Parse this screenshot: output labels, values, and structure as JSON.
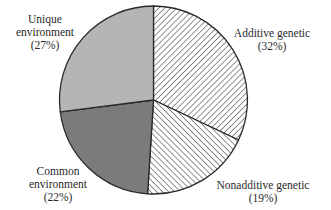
{
  "chart_data": {
    "type": "pie",
    "title": "",
    "start_angle_deg": 0,
    "direction": "clockwise",
    "slices": [
      {
        "label": "Additive genetic",
        "value": 32,
        "display": "(32%)",
        "fill": "hatch-forward",
        "color": "#ffffff"
      },
      {
        "label": "Nonadditive genetic",
        "value": 19,
        "display": "(19%)",
        "fill": "hatch-back",
        "color": "#ffffff"
      },
      {
        "label": "Common environment",
        "value": 22,
        "display": "(22%)",
        "fill": "solid",
        "color": "#7b7b7b"
      },
      {
        "label": "Unique environment",
        "value": 27,
        "display": "(27%)",
        "fill": "solid",
        "color": "#b5b5b5"
      }
    ],
    "categories": [
      "Additive genetic",
      "Nonadditive genetic",
      "Common environment",
      "Unique environment"
    ],
    "values": [
      32,
      19,
      22,
      27
    ],
    "legend": "none (direct labels)"
  },
  "labels": {
    "additive": {
      "line1": "Additive genetic",
      "line2": "(32%)"
    },
    "nonadditive": {
      "line1": "Nonadditive genetic",
      "line2": "(19%)"
    },
    "common": {
      "line1": "Common",
      "line2": "environment",
      "line3": "(22%)"
    },
    "unique": {
      "line1": "Unique",
      "line2": "environment",
      "line3": "(27%)"
    }
  },
  "colors": {
    "outline": "#2a2a2a",
    "unique": "#b5b5b5",
    "common": "#7b7b7b",
    "hatch": "#555555"
  }
}
